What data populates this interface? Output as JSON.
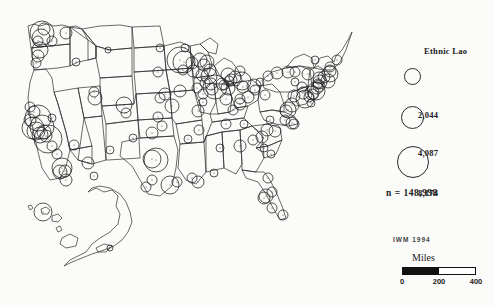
{
  "figure": {
    "title": "Ethnic Lao",
    "background_color": "#fbfbf9",
    "ink_color": "#2a2a2a"
  },
  "legend": {
    "title": "Ethnic Lao",
    "symbol_type": "proportional-circle",
    "classes": [
      {
        "label": "2,044",
        "value": 2044,
        "diameter_px": 15,
        "circle_x": 404,
        "circle_y": 68,
        "label_x": 38,
        "label_y": 70
      },
      {
        "label": "4,087",
        "value": 4087,
        "diameter_px": 21,
        "circle_x": 401,
        "circle_y": 106,
        "label_x": 38,
        "label_y": 108
      },
      {
        "label": "8,174",
        "value": 8174,
        "diameter_px": 30,
        "circle_x": 397,
        "circle_y": 146,
        "label_x": 38,
        "label_y": 148
      }
    ],
    "total_label": "n  =  148,998",
    "total_value": 148998
  },
  "attribution": {
    "text": "IWM  1994"
  },
  "scale": {
    "units_label": "Miles",
    "ticks": [
      "0",
      "200",
      "400"
    ],
    "tick_values": [
      0,
      200,
      400
    ],
    "tick_positions_pct": [
      0,
      50,
      100
    ],
    "bar_fill_pct": 50
  },
  "chart_data": {
    "type": "scatter",
    "title": "Ethnic Lao",
    "subtitle": "",
    "xlabel": "",
    "ylabel": "",
    "projection": "United States, Albers-style with Alaska and Hawaii insets",
    "symbol": "proportional circle, unfilled, black outline",
    "legend_breaks": [
      2044,
      4087,
      8174
    ],
    "total": 148998,
    "units": "persons",
    "points": [
      {
        "place": "Fresno CA",
        "x": 48,
        "y": 139,
        "r": 14
      },
      {
        "place": "Stockton CA",
        "x": 42,
        "y": 127,
        "r": 12
      },
      {
        "place": "Sacramento CA",
        "x": 38,
        "y": 118,
        "r": 13
      },
      {
        "place": "San Francisco Bay CA",
        "x": 33,
        "y": 128,
        "r": 11
      },
      {
        "place": "Oakland CA",
        "x": 36,
        "y": 131,
        "r": 9
      },
      {
        "place": "San Jose CA",
        "x": 40,
        "y": 135,
        "r": 8
      },
      {
        "place": "Modesto CA",
        "x": 44,
        "y": 132,
        "r": 7
      },
      {
        "place": "Merced CA",
        "x": 46,
        "y": 136,
        "r": 6
      },
      {
        "place": "Visalia CA",
        "x": 52,
        "y": 146,
        "r": 5
      },
      {
        "place": "Bakersfield CA",
        "x": 57,
        "y": 154,
        "r": 5
      },
      {
        "place": "Santa Rosa CA",
        "x": 30,
        "y": 120,
        "r": 6
      },
      {
        "place": "Redding CA",
        "x": 30,
        "y": 107,
        "r": 5
      },
      {
        "place": "Chico CA",
        "x": 34,
        "y": 112,
        "r": 6
      },
      {
        "place": "Los Angeles CA",
        "x": 62,
        "y": 168,
        "r": 10
      },
      {
        "place": "Long Beach CA",
        "x": 60,
        "y": 172,
        "r": 7
      },
      {
        "place": "San Diego CA",
        "x": 66,
        "y": 180,
        "r": 6
      },
      {
        "place": "Santa Ana CA",
        "x": 65,
        "y": 171,
        "r": 6
      },
      {
        "place": "Seattle WA",
        "x": 42,
        "y": 33,
        "r": 12
      },
      {
        "place": "Tacoma WA",
        "x": 41,
        "y": 38,
        "r": 9
      },
      {
        "place": "Everett WA",
        "x": 44,
        "y": 29,
        "r": 6
      },
      {
        "place": "Olympia WA",
        "x": 38,
        "y": 41,
        "r": 5
      },
      {
        "place": "Spokane WA",
        "x": 66,
        "y": 33,
        "r": 6
      },
      {
        "place": "Yakima WA",
        "x": 52,
        "y": 41,
        "r": 5
      },
      {
        "place": "Portland OR",
        "x": 40,
        "y": 50,
        "r": 8
      },
      {
        "place": "Salem OR",
        "x": 38,
        "y": 56,
        "r": 6
      },
      {
        "place": "Eugene OR",
        "x": 36,
        "y": 63,
        "r": 5
      },
      {
        "place": "Boise ID",
        "x": 76,
        "y": 62,
        "r": 4
      },
      {
        "place": "Salt Lake City UT",
        "x": 95,
        "y": 98,
        "r": 7
      },
      {
        "place": "Ogden UT",
        "x": 94,
        "y": 92,
        "r": 5
      },
      {
        "place": "Denver CO",
        "x": 124,
        "y": 105,
        "r": 8
      },
      {
        "place": "Colorado Springs CO",
        "x": 126,
        "y": 113,
        "r": 5
      },
      {
        "place": "Phoenix AZ",
        "x": 88,
        "y": 163,
        "r": 6
      },
      {
        "place": "Tucson AZ",
        "x": 94,
        "y": 176,
        "r": 4
      },
      {
        "place": "Las Vegas NV",
        "x": 74,
        "y": 145,
        "r": 5
      },
      {
        "place": "Reno NV",
        "x": 52,
        "y": 118,
        "r": 4
      },
      {
        "place": "Albuquerque NM",
        "x": 110,
        "y": 150,
        "r": 4
      },
      {
        "place": "Billings MT",
        "x": 108,
        "y": 50,
        "r": 3
      },
      {
        "place": "Fargo ND",
        "x": 160,
        "y": 48,
        "r": 4
      },
      {
        "place": "Sioux Falls SD",
        "x": 158,
        "y": 72,
        "r": 5
      },
      {
        "place": "Omaha NE",
        "x": 165,
        "y": 94,
        "r": 6
      },
      {
        "place": "Lincoln NE",
        "x": 160,
        "y": 98,
        "r": 5
      },
      {
        "place": "Des Moines IA",
        "x": 180,
        "y": 91,
        "r": 6
      },
      {
        "place": "Minneapolis MN",
        "x": 180,
        "y": 60,
        "r": 13
      },
      {
        "place": "St Paul MN",
        "x": 184,
        "y": 62,
        "r": 11
      },
      {
        "place": "Rochester MN",
        "x": 183,
        "y": 70,
        "r": 5
      },
      {
        "place": "Duluth MN",
        "x": 185,
        "y": 48,
        "r": 4
      },
      {
        "place": "Wausau WI",
        "x": 200,
        "y": 60,
        "r": 7
      },
      {
        "place": "Green Bay WI",
        "x": 207,
        "y": 62,
        "r": 7
      },
      {
        "place": "Appleton WI",
        "x": 204,
        "y": 65,
        "r": 6
      },
      {
        "place": "Milwaukee WI",
        "x": 209,
        "y": 76,
        "r": 8
      },
      {
        "place": "Madison WI",
        "x": 202,
        "y": 75,
        "r": 6
      },
      {
        "place": "Eau Claire WI",
        "x": 192,
        "y": 63,
        "r": 6
      },
      {
        "place": "La Crosse WI",
        "x": 193,
        "y": 71,
        "r": 6
      },
      {
        "place": "Sheboygan WI",
        "x": 210,
        "y": 70,
        "r": 6
      },
      {
        "place": "Rockford IL",
        "x": 205,
        "y": 83,
        "r": 5
      },
      {
        "place": "Chicago IL",
        "x": 215,
        "y": 87,
        "r": 12
      },
      {
        "place": "Elgin IL",
        "x": 211,
        "y": 84,
        "r": 6
      },
      {
        "place": "Aurora IL",
        "x": 212,
        "y": 89,
        "r": 6
      },
      {
        "place": "Rock Island IL",
        "x": 197,
        "y": 88,
        "r": 5
      },
      {
        "place": "Peoria IL",
        "x": 203,
        "y": 94,
        "r": 5
      },
      {
        "place": "Springfield IL",
        "x": 203,
        "y": 102,
        "r": 4
      },
      {
        "place": "St Louis MO",
        "x": 198,
        "y": 111,
        "r": 6
      },
      {
        "place": "Kansas City MO",
        "x": 172,
        "y": 106,
        "r": 7
      },
      {
        "place": "Wichita KS",
        "x": 158,
        "y": 117,
        "r": 5
      },
      {
        "place": "Indianapolis IN",
        "x": 226,
        "y": 99,
        "r": 6
      },
      {
        "place": "Fort Wayne IN",
        "x": 228,
        "y": 88,
        "r": 7
      },
      {
        "place": "South Bend IN",
        "x": 222,
        "y": 84,
        "r": 6
      },
      {
        "place": "Elkhart IN",
        "x": 224,
        "y": 85,
        "r": 5
      },
      {
        "place": "Detroit MI",
        "x": 242,
        "y": 81,
        "r": 9
      },
      {
        "place": "Grand Rapids MI",
        "x": 228,
        "y": 75,
        "r": 7
      },
      {
        "place": "Lansing MI",
        "x": 235,
        "y": 77,
        "r": 6
      },
      {
        "place": "Battle Creek MI",
        "x": 231,
        "y": 80,
        "r": 6
      },
      {
        "place": "Kalamazoo MI",
        "x": 229,
        "y": 81,
        "r": 5
      },
      {
        "place": "Saginaw MI",
        "x": 240,
        "y": 71,
        "r": 5
      },
      {
        "place": "Toledo OH",
        "x": 243,
        "y": 87,
        "r": 6
      },
      {
        "place": "Cleveland OH",
        "x": 254,
        "y": 86,
        "r": 7
      },
      {
        "place": "Akron OH",
        "x": 255,
        "y": 90,
        "r": 5
      },
      {
        "place": "Columbus OH",
        "x": 248,
        "y": 97,
        "r": 6
      },
      {
        "place": "Cincinnati OH",
        "x": 240,
        "y": 104,
        "r": 6
      },
      {
        "place": "Dayton OH",
        "x": 240,
        "y": 99,
        "r": 5
      },
      {
        "place": "Louisville KY",
        "x": 233,
        "y": 110,
        "r": 5
      },
      {
        "place": "Nashville TN",
        "x": 226,
        "y": 124,
        "r": 5
      },
      {
        "place": "Memphis TN",
        "x": 199,
        "y": 130,
        "r": 5
      },
      {
        "place": "Knoxville TN",
        "x": 244,
        "y": 124,
        "r": 4
      },
      {
        "place": "Oklahoma City OK",
        "x": 152,
        "y": 133,
        "r": 6
      },
      {
        "place": "Tulsa OK",
        "x": 162,
        "y": 126,
        "r": 5
      },
      {
        "place": "Dallas TX",
        "x": 156,
        "y": 160,
        "r": 12
      },
      {
        "place": "Fort Worth TX",
        "x": 152,
        "y": 159,
        "r": 9
      },
      {
        "place": "Amarillo TX",
        "x": 133,
        "y": 138,
        "r": 4
      },
      {
        "place": "Austin TX",
        "x": 152,
        "y": 180,
        "r": 5
      },
      {
        "place": "San Antonio TX",
        "x": 146,
        "y": 187,
        "r": 5
      },
      {
        "place": "Houston TX",
        "x": 170,
        "y": 185,
        "r": 9
      },
      {
        "place": "Beaumont TX",
        "x": 177,
        "y": 182,
        "r": 5
      },
      {
        "place": "Baton Rouge LA",
        "x": 192,
        "y": 178,
        "r": 5
      },
      {
        "place": "New Orleans LA",
        "x": 198,
        "y": 182,
        "r": 6
      },
      {
        "place": "Little Rock AR",
        "x": 188,
        "y": 139,
        "r": 4
      },
      {
        "place": "Birmingham AL",
        "x": 220,
        "y": 148,
        "r": 4
      },
      {
        "place": "Mobile AL",
        "x": 214,
        "y": 173,
        "r": 4
      },
      {
        "place": "Atlanta GA",
        "x": 240,
        "y": 146,
        "r": 6
      },
      {
        "place": "Jacksonville FL",
        "x": 268,
        "y": 178,
        "r": 5
      },
      {
        "place": "Orlando FL",
        "x": 272,
        "y": 192,
        "r": 5
      },
      {
        "place": "Tampa FL",
        "x": 266,
        "y": 196,
        "r": 7
      },
      {
        "place": "St Petersburg FL",
        "x": 264,
        "y": 198,
        "r": 6
      },
      {
        "place": "Fort Myers FL",
        "x": 272,
        "y": 208,
        "r": 5
      },
      {
        "place": "Miami FL",
        "x": 283,
        "y": 215,
        "r": 5
      },
      {
        "place": "Charlotte NC",
        "x": 262,
        "y": 137,
        "r": 6
      },
      {
        "place": "Greensboro NC",
        "x": 267,
        "y": 130,
        "r": 6
      },
      {
        "place": "Raleigh NC",
        "x": 275,
        "y": 131,
        "r": 6
      },
      {
        "place": "Charleston SC",
        "x": 271,
        "y": 154,
        "r": 4
      },
      {
        "place": "Columbia SC",
        "x": 264,
        "y": 148,
        "r": 4
      },
      {
        "place": "Greenville SC",
        "x": 253,
        "y": 140,
        "r": 5
      },
      {
        "place": "Richmond VA",
        "x": 285,
        "y": 120,
        "r": 5
      },
      {
        "place": "Norfolk VA",
        "x": 292,
        "y": 123,
        "r": 6
      },
      {
        "place": "Virginia Beach VA",
        "x": 294,
        "y": 124,
        "r": 5
      },
      {
        "place": "Roanoke VA",
        "x": 270,
        "y": 120,
        "r": 4
      },
      {
        "place": "Washington DC",
        "x": 288,
        "y": 110,
        "r": 8
      },
      {
        "place": "Arlington VA",
        "x": 286,
        "y": 111,
        "r": 6
      },
      {
        "place": "Baltimore MD",
        "x": 292,
        "y": 105,
        "r": 7
      },
      {
        "place": "Philadelphia PA",
        "x": 305,
        "y": 99,
        "r": 9
      },
      {
        "place": "Pittsburgh PA",
        "x": 265,
        "y": 95,
        "r": 5
      },
      {
        "place": "Harrisburg PA",
        "x": 294,
        "y": 96,
        "r": 6
      },
      {
        "place": "Allentown PA",
        "x": 303,
        "y": 93,
        "r": 6
      },
      {
        "place": "Scranton PA",
        "x": 302,
        "y": 87,
        "r": 5
      },
      {
        "place": "Erie PA",
        "x": 260,
        "y": 82,
        "r": 4
      },
      {
        "place": "Newark NJ",
        "x": 312,
        "y": 93,
        "r": 7
      },
      {
        "place": "Jersey City NJ",
        "x": 313,
        "y": 94,
        "r": 5
      },
      {
        "place": "Trenton NJ",
        "x": 309,
        "y": 97,
        "r": 5
      },
      {
        "place": "Atlantic City NJ",
        "x": 311,
        "y": 103,
        "r": 4
      },
      {
        "place": "New York NY",
        "x": 316,
        "y": 91,
        "r": 9
      },
      {
        "place": "Buffalo NY",
        "x": 268,
        "y": 76,
        "r": 5
      },
      {
        "place": "Rochester NY",
        "x": 277,
        "y": 73,
        "r": 6
      },
      {
        "place": "Syracuse NY",
        "x": 288,
        "y": 72,
        "r": 6
      },
      {
        "place": "Utica NY",
        "x": 295,
        "y": 72,
        "r": 5
      },
      {
        "place": "Albany NY",
        "x": 308,
        "y": 74,
        "r": 6
      },
      {
        "place": "Binghamton NY",
        "x": 295,
        "y": 82,
        "r": 4
      },
      {
        "place": "Hartford CT",
        "x": 320,
        "y": 82,
        "r": 7
      },
      {
        "place": "New Haven CT",
        "x": 319,
        "y": 86,
        "r": 6
      },
      {
        "place": "Bridgeport CT",
        "x": 317,
        "y": 88,
        "r": 6
      },
      {
        "place": "Waterbury CT",
        "x": 318,
        "y": 84,
        "r": 5
      },
      {
        "place": "Providence RI",
        "x": 328,
        "y": 81,
        "r": 7
      },
      {
        "place": "Boston MA",
        "x": 330,
        "y": 74,
        "r": 8
      },
      {
        "place": "Worcester MA",
        "x": 324,
        "y": 77,
        "r": 6
      },
      {
        "place": "Springfield MA",
        "x": 319,
        "y": 78,
        "r": 6
      },
      {
        "place": "Lowell MA",
        "x": 330,
        "y": 71,
        "r": 6
      },
      {
        "place": "Manchester NH",
        "x": 330,
        "y": 67,
        "r": 5
      },
      {
        "place": "Portland ME",
        "x": 337,
        "y": 60,
        "r": 5
      },
      {
        "place": "Burlington VT",
        "x": 315,
        "y": 60,
        "r": 4
      },
      {
        "place": "Honolulu HI",
        "x": 43,
        "y": 212,
        "r": 9
      },
      {
        "place": "Anchorage AK",
        "x": 110,
        "y": 248,
        "r": 3
      }
    ]
  }
}
